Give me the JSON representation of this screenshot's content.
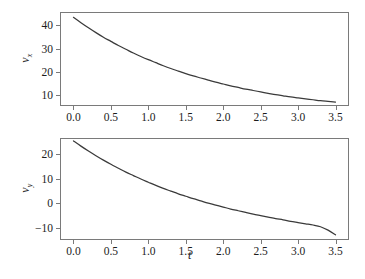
{
  "figure": {
    "background": "#ffffff",
    "curve_color": "#3a3a3a",
    "frame_color": "#7a7a7a"
  },
  "chart_data": [
    {
      "type": "line",
      "id": "vx-vs-t",
      "title": "",
      "xlabel": "",
      "ylabel": "v_x",
      "ylabel_base": "v",
      "ylabel_sub": "x",
      "xlim": [
        -0.18,
        3.68
      ],
      "ylim": [
        5.2,
        45.8
      ],
      "grid": false,
      "legend": false,
      "xticks": [
        0.0,
        0.5,
        1.0,
        1.5,
        2.0,
        2.5,
        3.0,
        3.5
      ],
      "xticklabels": [
        "0.0",
        "0.5",
        "1.0",
        "1.5",
        "2.0",
        "2.5",
        "3.0",
        "3.5"
      ],
      "yticks": [
        10,
        20,
        30,
        40
      ],
      "yticklabels": [
        "10",
        "20",
        "30",
        "40"
      ],
      "x": [
        0.0,
        0.1,
        0.2,
        0.3,
        0.4,
        0.5,
        0.6,
        0.7,
        0.8,
        0.9,
        1.0,
        1.1,
        1.2,
        1.3,
        1.4,
        1.5,
        1.6,
        1.7,
        1.8,
        1.9,
        2.0,
        2.1,
        2.2,
        2.3,
        2.4,
        2.5,
        2.6,
        2.7,
        2.8,
        2.9,
        3.0,
        3.1,
        3.2,
        3.3,
        3.4,
        3.5
      ],
      "y": [
        43.5,
        41.2,
        39.0,
        36.9,
        34.9,
        33.1,
        31.3,
        29.7,
        28.1,
        26.6,
        25.2,
        23.9,
        22.6,
        21.4,
        20.3,
        19.2,
        18.2,
        17.3,
        16.4,
        15.5,
        14.7,
        13.9,
        13.2,
        12.5,
        11.9,
        11.3,
        10.7,
        10.1,
        9.6,
        9.1,
        8.7,
        8.3,
        7.9,
        7.5,
        7.2,
        6.9
      ]
    },
    {
      "type": "line",
      "id": "vy-vs-t",
      "title": "",
      "xlabel": "t",
      "ylabel": "v_y",
      "ylabel_base": "v",
      "ylabel_sub": "y",
      "xlim": [
        -0.18,
        3.68
      ],
      "ylim": [
        -15.0,
        26.5
      ],
      "grid": false,
      "legend": false,
      "xticks": [
        0.0,
        0.5,
        1.0,
        1.5,
        2.0,
        2.5,
        3.0,
        3.5
      ],
      "xticklabels": [
        "0.0",
        "0.5",
        "1.0",
        "1.5",
        "2.0",
        "2.5",
        "3.0",
        "3.5"
      ],
      "yticks": [
        -10,
        0,
        10,
        20
      ],
      "yticklabels": [
        "−10",
        "0",
        "10",
        "20"
      ],
      "x": [
        0.0,
        0.1,
        0.2,
        0.3,
        0.4,
        0.5,
        0.6,
        0.7,
        0.8,
        0.9,
        1.0,
        1.1,
        1.2,
        1.3,
        1.4,
        1.5,
        1.6,
        1.7,
        1.8,
        1.9,
        2.0,
        2.1,
        2.2,
        2.3,
        2.4,
        2.5,
        2.6,
        2.7,
        2.8,
        2.9,
        3.0,
        3.1,
        3.2,
        3.3,
        3.4,
        3.5
      ],
      "y": [
        25.3,
        23.2,
        21.2,
        19.3,
        17.5,
        15.8,
        14.2,
        12.6,
        11.2,
        9.8,
        8.5,
        7.2,
        6.0,
        4.9,
        3.8,
        2.8,
        1.8,
        0.9,
        0.0,
        -0.8,
        -1.6,
        -2.4,
        -3.1,
        -3.8,
        -4.5,
        -5.1,
        -5.7,
        -6.3,
        -6.8,
        -7.4,
        -7.9,
        -8.4,
        -8.9,
        -9.6,
        -11.0,
        -12.9
      ]
    }
  ]
}
